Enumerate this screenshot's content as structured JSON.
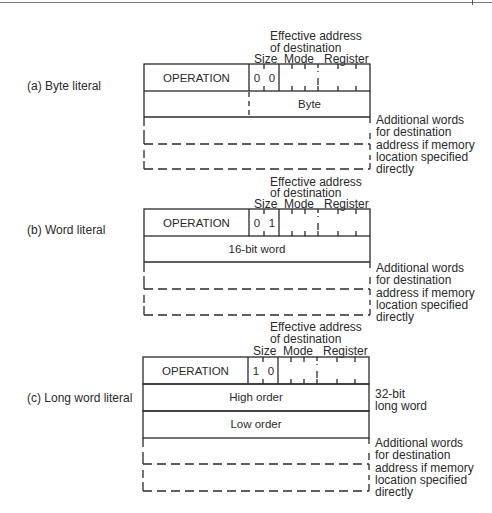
{
  "figure": {
    "common": {
      "ea_header_line1": "Effective address",
      "ea_header_line2": "of destination",
      "col_size": "Size",
      "col_mode": "Mode",
      "col_register": "Register",
      "operation": "OPERATION",
      "additional_words_note": [
        "Additional words",
        "for destination",
        "address if memory",
        "location specified",
        "directly"
      ]
    },
    "panels": [
      {
        "id": "a",
        "label": "(a)  Byte literal",
        "size_bits": [
          "0",
          "0"
        ],
        "data_rows": [
          {
            "text": "Byte",
            "upper_byte_unused": true
          }
        ]
      },
      {
        "id": "b",
        "label": "(b)  Word literal",
        "size_bits": [
          "0",
          "1"
        ],
        "data_rows": [
          {
            "text": "16-bit word"
          }
        ]
      },
      {
        "id": "c",
        "label": "(c)  Long word literal",
        "size_bits": [
          "1",
          "0"
        ],
        "data_rows": [
          {
            "text": "High order"
          },
          {
            "text": "Low order"
          }
        ],
        "long_word_note": [
          "32-bit",
          "long word"
        ]
      }
    ]
  },
  "colors": {
    "ink": "#2a2a2a",
    "paper": "#ffffff",
    "rule": "#7a7a7a"
  }
}
